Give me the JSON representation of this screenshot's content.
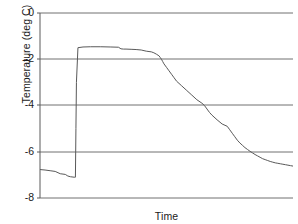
{
  "chart_data": {
    "type": "line",
    "title": "",
    "xlabel": "Time",
    "ylabel": "Temperature (deg C)",
    "ylim": [
      -8,
      0
    ],
    "xlim": [
      0,
      100
    ],
    "ytick_labels": [
      "0",
      "-2",
      "-4",
      "-6",
      "-8"
    ],
    "ytick_values": [
      0,
      -2,
      -4,
      -6,
      -8
    ],
    "xtick_labels": [],
    "grid": "horizontal",
    "legend": "none",
    "line_color": "#595959",
    "axis_color": "#595959",
    "grid_color": "#707070",
    "background_color": "#ffffff",
    "series": [
      {
        "name": "Temperature",
        "x": [
          0,
          2,
          4,
          6,
          8,
          10,
          11,
          12,
          13.5,
          14,
          14.2,
          14.4,
          15,
          17,
          20,
          24,
          28,
          31,
          32,
          33,
          34,
          36,
          38,
          40,
          42,
          44,
          45,
          46,
          47,
          47.5,
          48,
          48.5,
          49,
          50,
          51,
          52,
          53,
          54,
          56,
          58,
          60,
          62,
          64,
          65,
          66,
          67,
          68,
          70,
          72,
          74,
          75,
          76,
          77,
          78,
          79,
          80,
          81,
          82,
          83,
          84,
          85,
          86,
          87,
          88,
          89,
          90,
          91,
          92,
          93,
          94,
          95,
          96,
          97,
          98,
          99,
          100
        ],
        "y": [
          -6.77,
          -6.79,
          -6.82,
          -6.85,
          -6.95,
          -6.98,
          -7.05,
          -7.08,
          -7.1,
          -7.1,
          -5.0,
          -3.0,
          -1.5,
          -1.47,
          -1.46,
          -1.46,
          -1.47,
          -1.48,
          -1.55,
          -1.56,
          -1.56,
          -1.57,
          -1.58,
          -1.6,
          -1.65,
          -1.68,
          -1.72,
          -1.78,
          -1.85,
          -1.92,
          -2.0,
          -2.1,
          -2.2,
          -2.35,
          -2.5,
          -2.65,
          -2.8,
          -2.95,
          -3.15,
          -3.35,
          -3.55,
          -3.75,
          -3.9,
          -4.0,
          -4.15,
          -4.3,
          -4.42,
          -4.62,
          -4.8,
          -4.9,
          -5.05,
          -5.2,
          -5.35,
          -5.5,
          -5.62,
          -5.72,
          -5.82,
          -5.9,
          -5.98,
          -6.05,
          -6.12,
          -6.18,
          -6.24,
          -6.3,
          -6.34,
          -6.38,
          -6.42,
          -6.45,
          -6.48,
          -6.5,
          -6.52,
          -6.54,
          -6.56,
          -6.58,
          -6.6,
          -6.62
        ]
      }
    ],
    "annotations": [
      {
        "label": "initial supercooled plateau",
        "approx_y": -6.9
      },
      {
        "label": "nucleation jump",
        "approx_x": 14
      },
      {
        "label": "freezing plateau",
        "approx_y": -1.5
      },
      {
        "label": "cooling ramp to final value",
        "approx_y": -6.6
      }
    ]
  },
  "axes": {
    "ylabel": "Temperature (deg C)",
    "xlabel": "Time",
    "yticks": [
      {
        "label": "0",
        "value": 0
      },
      {
        "label": "-2",
        "value": -2
      },
      {
        "label": "-4",
        "value": -4
      },
      {
        "label": "-6",
        "value": -6
      },
      {
        "label": "-8",
        "value": -8
      }
    ]
  }
}
